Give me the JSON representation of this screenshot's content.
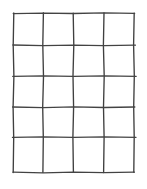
{
  "figure": {
    "kind": "line-drawing",
    "background_color": "#ffffff",
    "stroke_color": "#3b3b3b",
    "stroke_width_px": 1.35,
    "canvas": {
      "width_px": 147,
      "height_px": 189
    }
  },
  "grid": {
    "columns": 4,
    "rows": 5,
    "vertical_line_count": 5,
    "horizontal_line_count": 6,
    "bounds": {
      "left_px": 13.5,
      "top_px": 13.5,
      "right_px": 134,
      "bottom_px": 172
    },
    "vertical_x_px": [
      13.5,
      43,
      73,
      104,
      134
    ],
    "horizontal_y_px": [
      13.5,
      45,
      76,
      107,
      137,
      172
    ],
    "vertical_paths": [
      "M 13.8 13.0 L 13.2 45.4 L 13.9 76.2 L 13.1 107.2 L 13.7 137.4 L 13.2 172.6",
      "M 43.4 12.8 L 42.8 45.2 L 43.5 76.4 L 42.7 107.0 L 43.3 137.2 L 42.9 172.4",
      "M 73.2 13.2 L 73.8 45.0 L 73.0 76.0 L 73.6 107.4 L 72.9 137.0 L 73.4 172.2",
      "M 104.0 12.9 L 103.4 45.3 L 104.2 76.3 L 103.5 107.1 L 104.1 137.3 L 103.6 172.5",
      "M 134.2 13.1 L 133.6 45.1 L 134.3 76.1 L 133.7 107.3 L 134.2 137.1 L 133.8 172.3"
    ],
    "horizontal_paths": [
      "M 13.2 13.6 L 43.0 13.1 L 73.4 13.5 L 104.0 12.9 L 134.6 13.4",
      "M 12.9 45.0 L 43.2 45.6 L 73.6 45.1 L 103.8 45.7 L 135.4 45.2",
      "M 12.8 76.4 L 43.0 75.8 L 73.4 76.4 L 104.0 75.9 L 136.2 76.3",
      "M 12.6 107.0 L 43.2 107.6 L 73.8 106.9 L 104.2 107.5 L 134.8 107.0",
      "M 12.5 137.4 L 43.0 136.8 L 73.4 137.4 L 104.0 136.9 L 136.0 137.3",
      "M 13.0 172.2 L 43.2 172.8 L 73.6 172.1 L 104.0 172.7 L 134.4 172.2"
    ]
  }
}
